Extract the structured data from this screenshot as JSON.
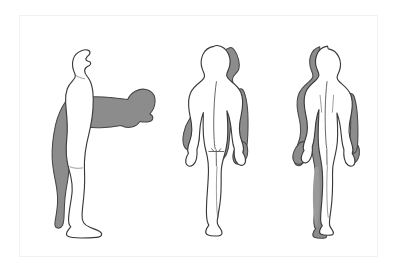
{
  "illustration": {
    "title": "Human body movement planes illustration",
    "description": "Three nude human figures in line-drawing style, each paired with a grey silhouette overlay showing a second body position.",
    "frame": {
      "border_color": "#f2f2f2",
      "background_color": "#ffffff"
    },
    "colors": {
      "outline_stroke": "#3a3a3a",
      "body_fill": "#ffffff",
      "shadow_fill": "#8c8c8c",
      "shadow_stroke": "#454545",
      "detail_line": "#4a4a4a",
      "page_background": "#ffffff"
    },
    "figures": [
      {
        "id": "figure-lateral",
        "position": "left",
        "view": "lateral (side) view, facing right",
        "base_pose": "standing upright in anatomical position",
        "shadow_pose": "trunk and head flexed forward to horizontal at the hips",
        "movement": "flexion",
        "plane": "sagittal",
        "shaded_regions": [
          "posterior trunk and head in flexed position",
          "buttock",
          "posterior thigh",
          "posterior calf",
          "heel"
        ]
      },
      {
        "id": "figure-posterior",
        "position": "center",
        "view": "posterior (back) view",
        "base_pose": "standing upright, arms at sides",
        "shadow_pose": "trunk laterally flexed and shifted to the subject's left",
        "movement": "lateral flexion / side bending",
        "plane": "frontal",
        "shaded_regions": [
          "displaced head and shoulder silhouette",
          "left arm and hand",
          "right arm and hand",
          "trailing side of trunk",
          "inner thigh and lower leg shading"
        ],
        "detail_marks": [
          "spinal midline groove",
          "gluteal cleft",
          "iliac crest tick marks"
        ]
      },
      {
        "id": "figure-frontal",
        "position": "right",
        "view": "posterior view, near-neutral",
        "base_pose": "standing upright, arms at sides",
        "shadow_pose": "slight lateral shift of the whole body toward the subject's right",
        "movement": "lateral shift / small amplitude side bending",
        "plane": "frontal",
        "shaded_regions": [
          "left side of head and neck",
          "left shoulder and arm",
          "both hands",
          "left lateral trunk",
          "left leg"
        ]
      }
    ]
  }
}
